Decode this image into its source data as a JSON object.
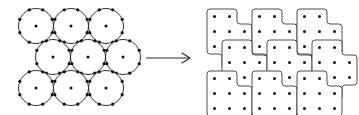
{
  "figure": {
    "background_color": "#ffffff",
    "stroke_color": "#1a1a1a",
    "dot_color": "#111111",
    "arrow_color": "#2a2a2a",
    "width": 359,
    "height": 115
  },
  "left_panel": {
    "name": "circle-packing",
    "description": "Nine congruent circles packed in three rows; middle row offset to the right by half a diameter",
    "circle_radius": 17.5,
    "boundary_marks_per_circle": 8,
    "boundary_mark_radius": 1.6,
    "center_dot_radius": 1.5,
    "rows": [
      {
        "row_index": 0,
        "cy": 26,
        "centers_x": [
          36,
          71,
          106
        ]
      },
      {
        "row_index": 1,
        "cy": 57,
        "centers_x": [
          53,
          88,
          123
        ]
      },
      {
        "row_index": 2,
        "cy": 88,
        "centers_x": [
          36,
          71,
          106
        ]
      }
    ],
    "circle_count": 9
  },
  "arrow": {
    "name": "transformation-arrow",
    "label": "",
    "x1": 146,
    "y1": 58,
    "x2": 190,
    "y2": 58,
    "head_length": 8,
    "head_spread": 5
  },
  "right_panel": {
    "name": "digital-disk-tiling",
    "description": "Nine digitized disk polyominoes tiling the plane; each contains nine lattice dots in a 3x3 arrangement",
    "cell_size": 15,
    "corner_radius": 3,
    "lattice_dot_radius": 1.5,
    "origin_x": 207,
    "origin_y": 9,
    "tiles": [
      {
        "tile_index": 0,
        "row": 0,
        "col": 0,
        "offset_x": 0,
        "offset_y": 0
      },
      {
        "tile_index": 1,
        "row": 0,
        "col": 1,
        "offset_x": 45,
        "offset_y": 0
      },
      {
        "tile_index": 2,
        "row": 0,
        "col": 2,
        "offset_x": 90,
        "offset_y": 0
      },
      {
        "tile_index": 3,
        "row": 1,
        "col": 0,
        "offset_x": 15,
        "offset_y": 31
      },
      {
        "tile_index": 4,
        "row": 1,
        "col": 1,
        "offset_x": 60,
        "offset_y": 31
      },
      {
        "tile_index": 5,
        "row": 1,
        "col": 2,
        "offset_x": 105,
        "offset_y": 31
      },
      {
        "tile_index": 6,
        "row": 2,
        "col": 0,
        "offset_x": 0,
        "offset_y": 62
      },
      {
        "tile_index": 7,
        "row": 2,
        "col": 1,
        "offset_x": 45,
        "offset_y": 62
      },
      {
        "tile_index": 8,
        "row": 2,
        "col": 2,
        "offset_x": 90,
        "offset_y": 62
      }
    ],
    "tile_count": 9,
    "dots_per_tile": 9
  }
}
